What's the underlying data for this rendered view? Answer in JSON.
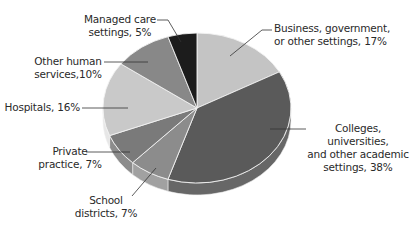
{
  "chart_data": {
    "type": "pie",
    "style": "3d-tilted",
    "title": "",
    "categories": [
      "Business, government, or other settings",
      "Colleges, universities, and other academic settings",
      "School districts",
      "Private practice",
      "Hospitals",
      "Other human services",
      "Managed care settings"
    ],
    "values": [
      17,
      38,
      7,
      7,
      16,
      10,
      5
    ],
    "unit": "%",
    "colors": [
      "#c4c4c4",
      "#5a5a5a",
      "#8c8c8c",
      "#7a7a7a",
      "#c9c9c9",
      "#888888",
      "#1c1c1c"
    ],
    "legend": "none (direct labels with leader lines)",
    "start_angle_deg": -90,
    "direction": "clockwise"
  },
  "labels": {
    "business": "Business, government,\nor other settings, 17%",
    "colleges": "Colleges, universities,\nand other academic\nsettings, 38%",
    "school": "School\ndistricts, 7%",
    "private": "Private\npractice, 7%",
    "hospitals": "Hospitals, 16%",
    "other_human": "Other human\nservices,10%",
    "managed": "Managed care\nsettings, 5%"
  }
}
